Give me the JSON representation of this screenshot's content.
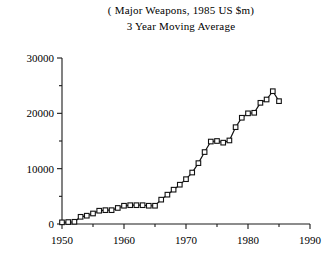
{
  "chart_data": {
    "type": "line",
    "title": "( Major Weapons, 1985 US $m)",
    "subtitle": "3 Year Moving Average",
    "xlabel": "",
    "ylabel": "",
    "xlim": [
      1950,
      1990
    ],
    "ylim": [
      0,
      30000
    ],
    "xticks": [
      1950,
      1960,
      1970,
      1980,
      1990
    ],
    "xticklabels": [
      "1950",
      "1960",
      "1970",
      "1980",
      "1990"
    ],
    "xticks_minor": [
      1955,
      1965,
      1975,
      1985
    ],
    "yticks": [
      0,
      10000,
      20000,
      30000
    ],
    "yticklabels": [
      "0",
      "10000",
      "20000",
      "30000"
    ],
    "yticks_minor": [
      5000,
      15000,
      25000
    ],
    "grid": false,
    "legend": false,
    "marker": "square",
    "x": [
      1950,
      1951,
      1952,
      1953,
      1954,
      1955,
      1956,
      1957,
      1958,
      1959,
      1960,
      1961,
      1962,
      1963,
      1964,
      1965,
      1966,
      1967,
      1968,
      1969,
      1970,
      1971,
      1972,
      1973,
      1974,
      1975,
      1976,
      1977,
      1978,
      1979,
      1980,
      1981,
      1982,
      1983,
      1984,
      1985
    ],
    "values": [
      300,
      350,
      400,
      1300,
      1500,
      1900,
      2400,
      2500,
      2500,
      2900,
      3300,
      3400,
      3400,
      3400,
      3300,
      3300,
      4400,
      5300,
      6200,
      7100,
      8100,
      9300,
      11000,
      13000,
      14900,
      15000,
      14700,
      15100,
      17500,
      19200,
      20000,
      20100,
      21900,
      22500,
      24000,
      22200
    ],
    "series_name": "Major weapons deliveries"
  },
  "axis": {
    "x_axis_name": "year-axis",
    "y_axis_name": "value-axis"
  }
}
